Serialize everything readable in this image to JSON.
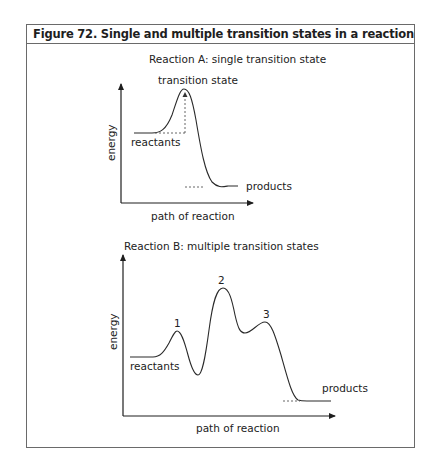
{
  "figure": {
    "title": "Figure 72. Single and multiple transition states in a reaction"
  },
  "reaction_a": {
    "title": "Reaction A: single transition state",
    "y_axis_label": "energy",
    "x_axis_label": "path of reaction",
    "labels": {
      "transition_state": "transition state",
      "reactants": "reactants",
      "products": "products"
    }
  },
  "reaction_b": {
    "title": "Reaction B: multiple transition states",
    "y_axis_label": "energy",
    "x_axis_label": "path of reaction",
    "labels": {
      "peak1": "1",
      "peak2": "2",
      "peak3": "3",
      "reactants": "reactants",
      "products": "products"
    }
  },
  "colors": {
    "line": "#2a2a2a",
    "border": "#6a6a6a",
    "dashed": "#555555"
  }
}
